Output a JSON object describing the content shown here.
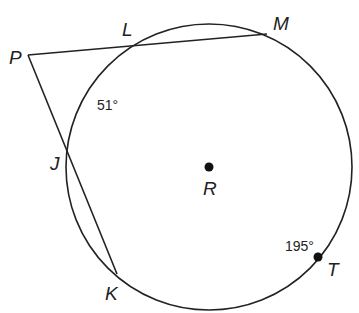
{
  "diagram": {
    "type": "circle-secants",
    "circle": {
      "center_label": "R",
      "cx": 209,
      "cy": 167,
      "r": 143
    },
    "points": {
      "P": {
        "label": "P",
        "x": 28,
        "y": 55
      },
      "L": {
        "label": "L",
        "x": 132,
        "y": 45
      },
      "M": {
        "label": "M",
        "x": 267,
        "y": 34
      },
      "J": {
        "label": "J",
        "x": 68,
        "y": 143
      },
      "K": {
        "label": "K",
        "x": 117,
        "y": 274
      },
      "T": {
        "label": "T",
        "x": 318,
        "y": 257
      },
      "R": {
        "label": "R",
        "x": 209,
        "y": 167
      }
    },
    "segments": [
      {
        "from": "P",
        "to": "M"
      },
      {
        "from": "P",
        "to": "K"
      }
    ],
    "arc_measures": {
      "LJ": "51°",
      "MTK": "195°"
    }
  }
}
